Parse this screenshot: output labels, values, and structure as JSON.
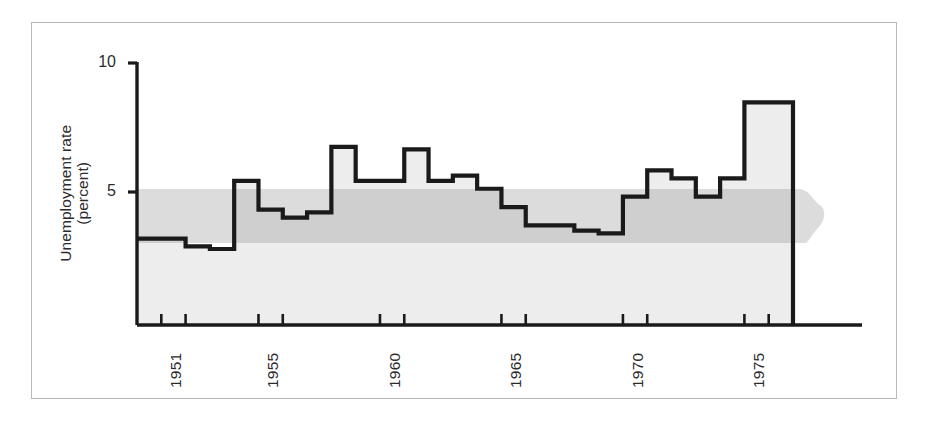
{
  "figure": {
    "background_color": "#ffffff",
    "frame_color": "#b9b9b9",
    "line_color": "#1a1a1a",
    "fill_color": "#ededed",
    "band_color": "#dcdcdc",
    "band_overlap_color": "#cfcfcf"
  },
  "axis": {
    "y_label_line1": "Unemployment rate",
    "y_label_line2": "(percent)",
    "y_ticks": [
      "10",
      "5"
    ],
    "y_tick_10": "10",
    "y_tick_5": "5",
    "x_tick_labels": [
      "1951",
      "1955",
      "1960",
      "1965",
      "1970",
      "1975"
    ]
  },
  "chart_data": {
    "type": "area",
    "title": "",
    "subtitle": "",
    "xlabel": "",
    "ylabel": "Unemployment rate (percent)",
    "xlim": [
      1950.0,
      1977.0
    ],
    "ylim": [
      0,
      10
    ],
    "ytick_values": [
      5,
      10
    ],
    "ytick_labels": [
      "5",
      "10"
    ],
    "xtick_values": [
      1951,
      1955,
      1960,
      1965,
      1970,
      1975
    ],
    "xtick_labels": [
      "1951",
      "1955",
      "1960",
      "1965",
      "1970",
      "1975"
    ],
    "grid": false,
    "legend": "none",
    "step_style": "post",
    "series_name": "Unemployment rate",
    "x": [
      1950,
      1951,
      1952,
      1953,
      1954,
      1955,
      1956,
      1957,
      1958,
      1959,
      1960,
      1961,
      1962,
      1963,
      1964,
      1965,
      1966,
      1967,
      1968,
      1969,
      1970,
      1971,
      1972,
      1973,
      1974,
      1975,
      1976
    ],
    "values": [
      3.3,
      3.3,
      3.0,
      2.9,
      5.5,
      4.4,
      4.1,
      4.3,
      6.8,
      5.5,
      5.5,
      6.7,
      5.5,
      5.7,
      5.2,
      4.5,
      3.8,
      3.8,
      3.6,
      3.5,
      4.9,
      5.9,
      5.6,
      4.9,
      5.6,
      8.5,
      8.5
    ],
    "annotations": [
      {
        "name": "shaded-band",
        "type": "horizontal-band",
        "y_low": 3.1,
        "y_high": 5.2,
        "description": "shaded horizontal reference band extending past the right edge of the axis"
      }
    ]
  }
}
